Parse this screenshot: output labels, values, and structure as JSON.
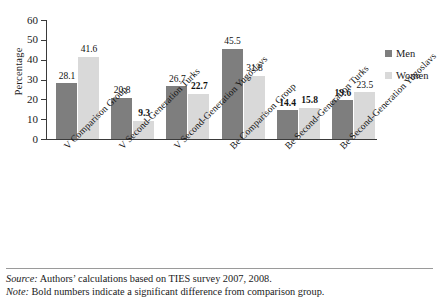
{
  "chart_data": {
    "type": "bar",
    "title": "",
    "xlabel": "",
    "ylabel": "Percentage",
    "ylim": [
      0,
      60
    ],
    "ytick_step": 10,
    "yticks": [
      60,
      50,
      40,
      30,
      20,
      10,
      0
    ],
    "grid": false,
    "legend_position": "right",
    "categories": [
      "V Comparison Group",
      "V Second-Generation Turks",
      "V Second-Generation Yugoslavs",
      "Be Comparison Group",
      "Be Second-Generation Turks",
      "Be Second-Generation Yugoslavs"
    ],
    "series": [
      {
        "name": "Men",
        "color": "#7e7e7e",
        "values": [
          28.1,
          20.8,
          26.7,
          45.5,
          14.4,
          19.6
        ],
        "labels": [
          "28.1",
          "20.8",
          "26.7",
          "45.5",
          "14.4",
          "19.6"
        ],
        "significant": [
          false,
          false,
          false,
          false,
          true,
          true
        ]
      },
      {
        "name": "Women",
        "color": "#d9d9d9",
        "values": [
          41.6,
          9.3,
          22.7,
          31.8,
          15.8,
          23.5
        ],
        "labels": [
          "41.6",
          "9.3",
          "22.7",
          "31.8",
          "15.8",
          "23.5"
        ],
        "significant": [
          false,
          true,
          true,
          false,
          true,
          false
        ]
      }
    ]
  },
  "legend": {
    "items": [
      {
        "label": "Men",
        "color": "#7e7e7e"
      },
      {
        "label": "Women",
        "color": "#d9d9d9"
      }
    ]
  },
  "footer": {
    "source_key": "Source:",
    "source_text": " Authors’ calculations based on TIES survey 2007, 2008.",
    "note_key": "Note:",
    "note_text": " Bold numbers indicate a significant difference from comparison group."
  }
}
